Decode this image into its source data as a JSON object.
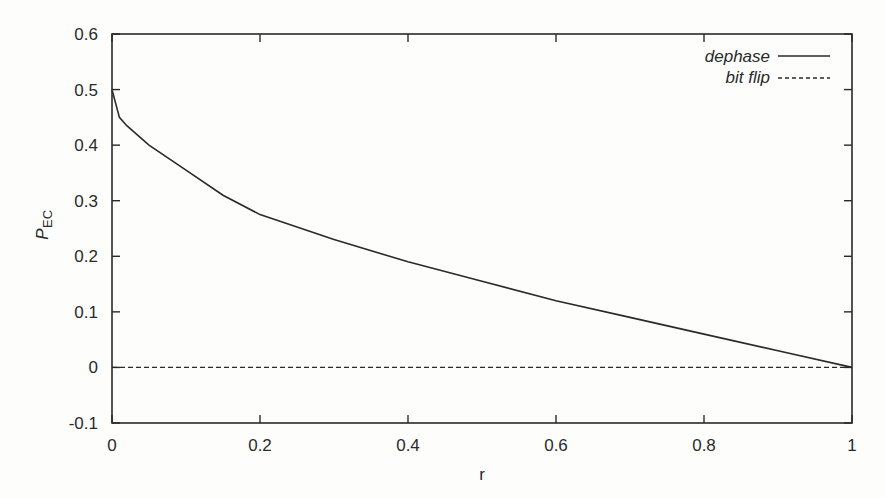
{
  "chart_data": {
    "type": "line",
    "title": "",
    "xlabel": "r",
    "ylabel": "P_EC",
    "ylabel_main": "P",
    "ylabel_sub": "EC",
    "xlim": [
      0,
      1
    ],
    "ylim": [
      -0.1,
      0.6
    ],
    "grid": false,
    "legend_position": "top-right",
    "x_ticks": [
      "0",
      "0.2",
      "0.4",
      "0.6",
      "0.8",
      "1"
    ],
    "y_ticks": [
      "-0.1",
      "0",
      "0.1",
      "0.2",
      "0.3",
      "0.4",
      "0.5",
      "0.6"
    ],
    "x": [
      0,
      0.01,
      0.02,
      0.05,
      0.1,
      0.15,
      0.2,
      0.3,
      0.4,
      0.5,
      0.6,
      0.7,
      0.8,
      0.9,
      1.0
    ],
    "series": [
      {
        "name": "dephase",
        "style": "solid",
        "values": [
          0.5,
          0.45,
          0.435,
          0.4,
          0.355,
          0.31,
          0.275,
          0.23,
          0.19,
          0.155,
          0.12,
          0.09,
          0.06,
          0.03,
          0.0
        ]
      },
      {
        "name": "bit flip",
        "style": "dashed",
        "values": [
          0,
          0,
          0,
          0,
          0,
          0,
          0,
          0,
          0,
          0,
          0,
          0,
          0,
          0,
          0
        ]
      }
    ]
  }
}
